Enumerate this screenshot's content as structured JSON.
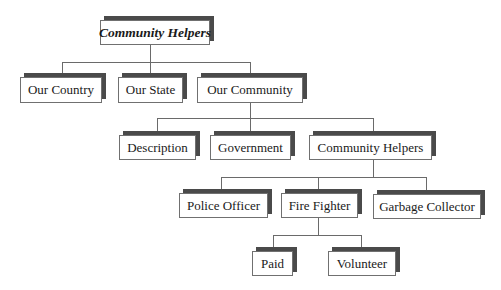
{
  "diagram": {
    "type": "hierarchy-tree",
    "root": {
      "label": "Community Helpers",
      "style": "bold-italic"
    },
    "level1": [
      {
        "label": "Our Country"
      },
      {
        "label": "Our State"
      },
      {
        "label": "Our Community"
      }
    ],
    "level2": [
      {
        "label": "Description"
      },
      {
        "label": "Government"
      },
      {
        "label": "Community Helpers"
      }
    ],
    "level3": [
      {
        "label": "Police Officer"
      },
      {
        "label": "Fire Fighter"
      },
      {
        "label": "Garbage Collector"
      }
    ],
    "level4": [
      {
        "label": "Paid"
      },
      {
        "label": "Volunteer"
      }
    ],
    "edges": [
      [
        "Community Helpers",
        "Our Country"
      ],
      [
        "Community Helpers",
        "Our State"
      ],
      [
        "Community Helpers",
        "Our Community"
      ],
      [
        "Our Community",
        "Description"
      ],
      [
        "Our Community",
        "Government"
      ],
      [
        "Our Community",
        "Community Helpers"
      ],
      [
        "Community Helpers",
        "Police Officer"
      ],
      [
        "Community Helpers",
        "Fire Fighter"
      ],
      [
        "Community Helpers",
        "Garbage Collector"
      ],
      [
        "Fire Fighter",
        "Paid"
      ],
      [
        "Fire Fighter",
        "Volunteer"
      ]
    ],
    "colors": {
      "shadow": "#4a4a4a",
      "border": "#707070",
      "connector": "#6a6a6a",
      "background": "#ffffff"
    }
  }
}
